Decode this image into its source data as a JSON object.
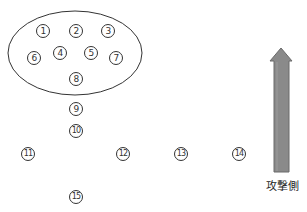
{
  "diagram": {
    "group_ellipse": {
      "cx": 75,
      "cy": 53,
      "rx": 67,
      "ry": 42,
      "stroke": "#333333"
    },
    "players": [
      {
        "label": "1",
        "x": 43,
        "y": 31
      },
      {
        "label": "2",
        "x": 76,
        "y": 31
      },
      {
        "label": "3",
        "x": 108,
        "y": 31
      },
      {
        "label": "4",
        "x": 60,
        "y": 53
      },
      {
        "label": "5",
        "x": 91,
        "y": 53
      },
      {
        "label": "6",
        "x": 34,
        "y": 58
      },
      {
        "label": "7",
        "x": 116,
        "y": 58
      },
      {
        "label": "8",
        "x": 76,
        "y": 79
      },
      {
        "label": "9",
        "x": 76,
        "y": 109
      },
      {
        "label": "10",
        "x": 76,
        "y": 131
      },
      {
        "label": "11",
        "x": 28,
        "y": 154
      },
      {
        "label": "12",
        "x": 123,
        "y": 154
      },
      {
        "label": "13",
        "x": 181,
        "y": 154
      },
      {
        "label": "14",
        "x": 239,
        "y": 154
      },
      {
        "label": "15",
        "x": 76,
        "y": 197
      }
    ],
    "arrow": {
      "direction": "up",
      "color": "#8a8a8a",
      "stroke": "#6a6a6a",
      "label": "攻撃側"
    }
  }
}
